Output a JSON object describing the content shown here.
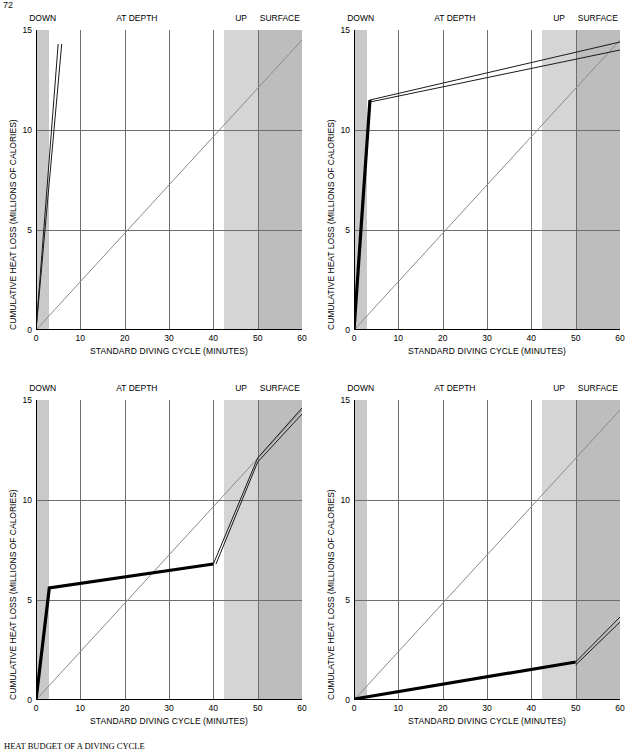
{
  "page": {
    "number": "72"
  },
  "caption": {
    "lead": "HEAT BUDGET OF A DIVING CYCLE",
    "rest": "studies the exchange of heat between a diver and the surrounding water."
  },
  "axes": {
    "x_title": "STANDARD DIVING CYCLE (MINUTES)",
    "y_title": "CUMULATIVE HEAT LOSS (MILLIONS OF CALORIES)",
    "x_ticks": [
      "0",
      "10",
      "20",
      "30",
      "40",
      "50",
      "60"
    ],
    "y_ticks": [
      "0",
      "5",
      "10",
      "15"
    ],
    "xlim": [
      0,
      60
    ],
    "ylim": [
      0,
      15
    ]
  },
  "phases": [
    {
      "label": "DOWN",
      "start": 0,
      "end": 3,
      "shade": "#c9c9c9"
    },
    {
      "label": "AT DEPTH",
      "start": 3,
      "end": 42.5,
      "shade": "#ffffff"
    },
    {
      "label": "UP",
      "start": 42.5,
      "end": 50,
      "shade": "#d5d5d5"
    },
    {
      "label": "SURFACE",
      "start": 50,
      "end": 60,
      "shade": "#bdbdbd"
    }
  ],
  "colors": {
    "reference_line": "#8a8a8a",
    "thick_line": "#000000",
    "thin_line": "#1a1a1a",
    "gridline": "#6e6e6e",
    "axis": "#000000"
  },
  "chart_data": [
    {
      "id": "top-left",
      "type": "line",
      "title": "",
      "xlabel": "STANDARD DIVING CYCLE (MINUTES)",
      "ylabel": "CUMULATIVE HEAT LOSS (MILLIONS OF CALORIES)",
      "xlim": [
        0,
        60
      ],
      "ylim": [
        0,
        15
      ],
      "grid": true,
      "series": [
        {
          "name": "reference",
          "style": "thin-gray",
          "x": [
            0,
            60
          ],
          "y": [
            0,
            14.5
          ]
        },
        {
          "name": "heat-loss-upper",
          "style": "thin-black",
          "x": [
            0,
            5.0
          ],
          "y": [
            0,
            14.3
          ]
        },
        {
          "name": "heat-loss-lower",
          "style": "thin-black",
          "x": [
            0,
            5.8
          ],
          "y": [
            0,
            14.3
          ]
        }
      ]
    },
    {
      "id": "top-right",
      "type": "line",
      "title": "",
      "xlabel": "STANDARD DIVING CYCLE (MINUTES)",
      "ylabel": "CUMULATIVE HEAT LOSS (MILLIONS OF CALORIES)",
      "xlim": [
        0,
        60
      ],
      "ylim": [
        0,
        15
      ],
      "grid": true,
      "series": [
        {
          "name": "reference",
          "style": "thin-gray",
          "x": [
            0,
            60
          ],
          "y": [
            0,
            14.5
          ]
        },
        {
          "name": "heat-loss-thick",
          "style": "thick-black",
          "x": [
            0,
            3.6
          ],
          "y": [
            0,
            11.5
          ]
        },
        {
          "name": "heat-loss-upper",
          "style": "thin-black",
          "x": [
            3.6,
            60
          ],
          "y": [
            11.5,
            14.4
          ]
        },
        {
          "name": "heat-loss-lower",
          "style": "thin-black",
          "x": [
            3.6,
            60
          ],
          "y": [
            11.4,
            14.0
          ]
        }
      ]
    },
    {
      "id": "bottom-left",
      "type": "line",
      "title": "",
      "xlabel": "STANDARD DIVING CYCLE (MINUTES)",
      "ylabel": "CUMULATIVE HEAT LOSS (MILLIONS OF CALORIES)",
      "xlim": [
        0,
        60
      ],
      "ylim": [
        0,
        15
      ],
      "grid": true,
      "series": [
        {
          "name": "reference",
          "style": "thin-gray",
          "x": [
            0,
            60
          ],
          "y": [
            0,
            14.5
          ]
        },
        {
          "name": "heat-loss-thick",
          "style": "thick-black",
          "x": [
            0,
            3.0,
            40.0
          ],
          "y": [
            0,
            5.6,
            6.8
          ]
        },
        {
          "name": "heat-loss-upper",
          "style": "thin-black",
          "x": [
            40.0,
            50.0,
            60.0
          ],
          "y": [
            6.8,
            12.1,
            14.6
          ]
        },
        {
          "name": "heat-loss-lower",
          "style": "thin-black",
          "x": [
            40.6,
            50.0,
            60.0
          ],
          "y": [
            6.8,
            11.9,
            14.3
          ]
        }
      ]
    },
    {
      "id": "bottom-right",
      "type": "line",
      "title": "",
      "xlabel": "STANDARD DIVING CYCLE (MINUTES)",
      "ylabel": "CUMULATIVE HEAT LOSS (MILLIONS OF CALORIES)",
      "xlim": [
        0,
        60
      ],
      "ylim": [
        0,
        15
      ],
      "grid": true,
      "series": [
        {
          "name": "reference",
          "style": "thin-gray",
          "x": [
            0,
            60
          ],
          "y": [
            0,
            14.5
          ]
        },
        {
          "name": "heat-loss-thick",
          "style": "thick-black",
          "x": [
            0,
            50.0
          ],
          "y": [
            0.05,
            1.9
          ]
        },
        {
          "name": "heat-loss-upper",
          "style": "thin-black",
          "x": [
            50.0,
            60.0
          ],
          "y": [
            1.9,
            4.15
          ]
        },
        {
          "name": "heat-loss-lower",
          "style": "thin-black",
          "x": [
            50.0,
            60.0
          ],
          "y": [
            1.75,
            3.9
          ]
        }
      ]
    }
  ]
}
